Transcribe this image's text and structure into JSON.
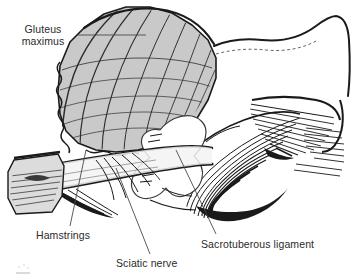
{
  "figure": {
    "kind": "anatomical-line-illustration",
    "background_color": "#ffffff",
    "ink_color": "#1a1a1a",
    "muscle_fill_color": "#c9c9c9",
    "muscle_fill_light": "#e4e4e4",
    "label_text_color": "#2a2a2a",
    "width": 354,
    "height": 279
  },
  "labels": [
    {
      "id": "gluteus-maximus",
      "line1": "Gluteus",
      "line2": "maximus",
      "leader": "horizontal line from label to muscle belly"
    },
    {
      "id": "hamstrings",
      "text": "Hamstrings",
      "leader": "near-vertical line rising to hamstring origin"
    },
    {
      "id": "sciatic-nerve",
      "text": "Sciatic nerve",
      "leader": "diagonal line rising left to nerve trunk"
    },
    {
      "id": "sacrotuberous-ligament",
      "text": "Sacrotuberous ligament",
      "leader": "diagonal line rising left to ligament fibres"
    }
  ],
  "structures": [
    {
      "id": "gluteus-maximus-flap",
      "description": "Large shaded striated muscle fan, upper left, reflected"
    },
    {
      "id": "sacrotuberous-ligament-fibres",
      "description": "Dense converging fibre hatching, centre right"
    },
    {
      "id": "sciatic-nerve-trunk",
      "description": "Broad pale band crossing obliquely below the muscle"
    },
    {
      "id": "hamstring-origin",
      "description": "Shaded cut block at left margin with fibre lines"
    },
    {
      "id": "ischium-bone",
      "description": "Outlined bony contour upper right with hatched shading"
    },
    {
      "id": "gluteal-fascia-edge",
      "description": "Heavy contour sweeping to the right margin"
    }
  ]
}
